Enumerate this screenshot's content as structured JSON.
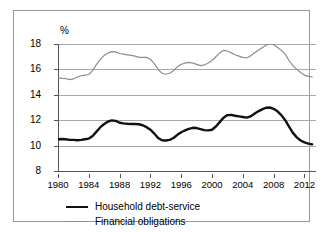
{
  "chart_data": {
    "type": "line",
    "title": "",
    "subtitle": "",
    "xlabel": "",
    "ylabel": "%",
    "unit_label": "%",
    "xlim": [
      1980,
      2013.5
    ],
    "ylim": [
      8,
      18
    ],
    "yticks": [
      8,
      10,
      12,
      14,
      16,
      18
    ],
    "xticks": [
      1980,
      1984,
      1988,
      1992,
      1996,
      2000,
      2004,
      2008,
      2012
    ],
    "ytick_labels": [
      "8",
      "10",
      "12",
      "14",
      "16",
      "18"
    ],
    "xtick_labels": [
      "1980",
      "1984",
      "1988",
      "1992",
      "1996",
      "2000",
      "2004",
      "2008",
      "2012"
    ],
    "grid": true,
    "grid_axis": "y",
    "legend_position": "below-plot",
    "series": [
      {
        "name": "Household debt-service",
        "color": "#111111",
        "width": 2.4,
        "x": [
          1980.0,
          1980.5,
          1981.0,
          1981.5,
          1982.0,
          1982.5,
          1983.0,
          1983.5,
          1984.0,
          1984.5,
          1985.0,
          1985.5,
          1986.0,
          1986.5,
          1987.0,
          1987.5,
          1988.0,
          1988.5,
          1989.0,
          1989.5,
          1990.0,
          1990.5,
          1991.0,
          1991.5,
          1992.0,
          1992.5,
          1993.0,
          1993.5,
          1994.0,
          1994.5,
          1995.0,
          1995.5,
          1996.0,
          1996.5,
          1997.0,
          1997.5,
          1998.0,
          1998.5,
          1999.0,
          1999.5,
          2000.0,
          2000.5,
          2001.0,
          2001.5,
          2002.0,
          2002.5,
          2003.0,
          2003.5,
          2004.0,
          2004.5,
          2005.0,
          2005.5,
          2006.0,
          2006.5,
          2007.0,
          2007.5,
          2008.0,
          2008.5,
          2009.0,
          2009.5,
          2010.0,
          2010.5,
          2011.0,
          2011.5,
          2012.0,
          2012.5,
          2013.0
        ],
        "values": [
          10.5,
          10.52,
          10.5,
          10.45,
          10.45,
          10.42,
          10.45,
          10.5,
          10.55,
          10.75,
          11.1,
          11.45,
          11.7,
          11.9,
          11.98,
          11.95,
          11.8,
          11.75,
          11.72,
          11.7,
          11.7,
          11.68,
          11.6,
          11.45,
          11.25,
          10.95,
          10.6,
          10.42,
          10.4,
          10.45,
          10.6,
          10.85,
          11.05,
          11.2,
          11.32,
          11.4,
          11.38,
          11.3,
          11.22,
          11.2,
          11.25,
          11.5,
          11.85,
          12.2,
          12.4,
          12.42,
          12.35,
          12.3,
          12.25,
          12.2,
          12.3,
          12.5,
          12.7,
          12.85,
          12.98,
          13.0,
          12.9,
          12.7,
          12.4,
          12.0,
          11.5,
          11.0,
          10.65,
          10.4,
          10.25,
          10.15,
          10.1
        ]
      },
      {
        "name": "Financial obligations",
        "color": "#8d8d8d",
        "width": 1.2,
        "x": [
          1980.0,
          1980.5,
          1981.0,
          1981.5,
          1982.0,
          1982.5,
          1983.0,
          1983.5,
          1984.0,
          1984.5,
          1985.0,
          1985.5,
          1986.0,
          1986.5,
          1987.0,
          1987.5,
          1988.0,
          1988.5,
          1989.0,
          1989.5,
          1990.0,
          1990.5,
          1991.0,
          1991.5,
          1992.0,
          1992.5,
          1993.0,
          1993.5,
          1994.0,
          1994.5,
          1995.0,
          1995.5,
          1996.0,
          1996.5,
          1997.0,
          1997.5,
          1998.0,
          1998.5,
          1999.0,
          1999.5,
          2000.0,
          2000.5,
          2001.0,
          2001.5,
          2002.0,
          2002.5,
          2003.0,
          2003.5,
          2004.0,
          2004.5,
          2005.0,
          2005.5,
          2006.0,
          2006.5,
          2007.0,
          2007.5,
          2008.0,
          2008.5,
          2009.0,
          2009.5,
          2010.0,
          2010.5,
          2011.0,
          2011.5,
          2012.0,
          2012.5,
          2013.0
        ],
        "values": [
          15.35,
          15.3,
          15.28,
          15.2,
          15.25,
          15.4,
          15.5,
          15.55,
          15.6,
          15.9,
          16.4,
          16.8,
          17.1,
          17.3,
          17.4,
          17.38,
          17.25,
          17.2,
          17.15,
          17.1,
          17.05,
          16.95,
          16.95,
          16.95,
          16.8,
          16.45,
          16.0,
          15.7,
          15.62,
          15.7,
          15.9,
          16.2,
          16.4,
          16.5,
          16.55,
          16.5,
          16.4,
          16.3,
          16.35,
          16.5,
          16.7,
          17.0,
          17.3,
          17.5,
          17.45,
          17.3,
          17.15,
          17.05,
          16.95,
          16.9,
          17.05,
          17.3,
          17.5,
          17.7,
          17.9,
          18.0,
          17.95,
          17.75,
          17.5,
          17.2,
          16.7,
          16.3,
          16.0,
          15.75,
          15.55,
          15.45,
          15.4
        ]
      }
    ]
  },
  "legend": {
    "items": [
      {
        "label": "Household debt-service",
        "style": "thick-black"
      },
      {
        "label": "Financial obligations",
        "style": "thin-gray"
      }
    ]
  }
}
